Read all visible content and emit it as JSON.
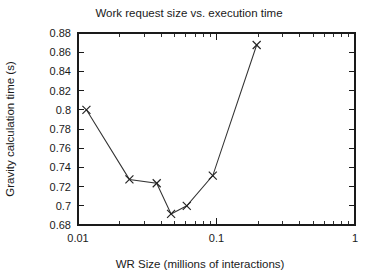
{
  "chart_data": {
    "type": "line",
    "title": "Work request size vs. execution time",
    "xlabel": "WR Size (millions of interactions)",
    "ylabel": "Gravity calculation time (s)",
    "xscale": "log",
    "yscale": "linear",
    "xlim": [
      0.01,
      1
    ],
    "ylim": [
      0.68,
      0.88
    ],
    "grid": false,
    "legend": null,
    "marker": "x",
    "x": [
      0.0115,
      0.0235,
      0.037,
      0.047,
      0.061,
      0.094,
      0.195
    ],
    "values": [
      0.8,
      0.7275,
      0.7235,
      0.6915,
      0.7,
      0.7315,
      0.8675
    ],
    "series": [
      {
        "name": "Gravity calculation time",
        "x": [
          0.0115,
          0.0235,
          0.037,
          0.047,
          0.061,
          0.094,
          0.195
        ],
        "values": [
          0.8,
          0.7275,
          0.7235,
          0.6915,
          0.7,
          0.7315,
          0.8675
        ]
      }
    ],
    "ytick_labels": [
      "0.68",
      "0.7",
      "0.72",
      "0.74",
      "0.76",
      "0.78",
      "0.8",
      "0.82",
      "0.84",
      "0.86",
      "0.88"
    ],
    "ytick_values": [
      0.68,
      0.7,
      0.72,
      0.74,
      0.76,
      0.78,
      0.8,
      0.82,
      0.84,
      0.86,
      0.88
    ],
    "xtick_labels": [
      "0.01",
      "0.1",
      "1"
    ],
    "xtick_values": [
      0.01,
      0.1,
      1
    ],
    "line_color": "#333333",
    "marker_color": "#222222",
    "axis_color": "#1a1a1a",
    "background_color": "#ffffff"
  }
}
